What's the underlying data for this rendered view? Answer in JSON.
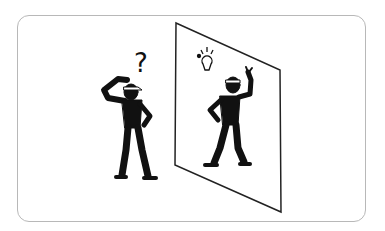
{
  "illustration": {
    "description": "Man scratching head in confusion facing a mirror; reflection shows him with a raised finger and a lightbulb idea",
    "question_mark": "?",
    "colors": {
      "figure": "#111111",
      "frame": "#b8b8b8",
      "mirror": "#222222",
      "background": "#ffffff"
    }
  }
}
